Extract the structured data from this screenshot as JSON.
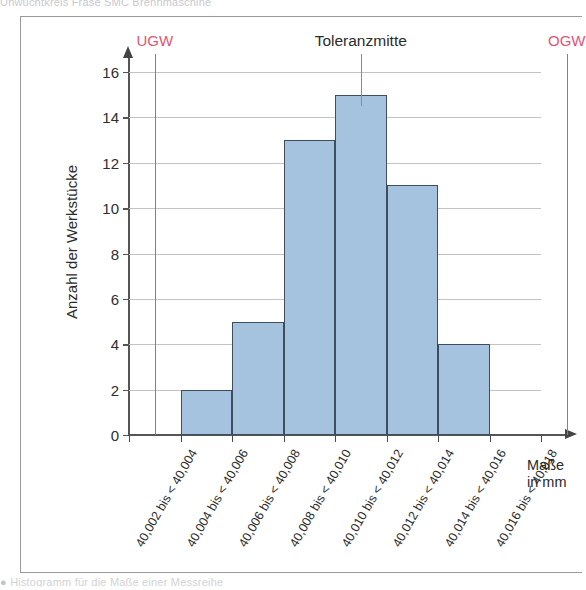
{
  "page": {
    "clipped_top_caption": "Unwuchtkreis Fräse SMC Brennmaschine",
    "clipped_bottom_caption": "Histogramm für die Maße einer Messreihe"
  },
  "chart_data": {
    "type": "bar",
    "title": "",
    "xlabel": "Maße in mm",
    "ylabel": "Anzahl der Werkstücke",
    "categories": [
      "40,002 bis < 40,004",
      "40,004 bis < 40,006",
      "40,006 bis < 40,008",
      "40,008 bis < 40,010",
      "40,010 bis < 40,012",
      "40,012 bis < 40,014",
      "40,014 bis < 40,016",
      "40,016 bis < 40,018"
    ],
    "values": [
      0,
      2,
      5,
      13,
      15,
      11,
      4,
      0
    ],
    "ylim": [
      0,
      16
    ],
    "yticks": [
      0,
      2,
      4,
      6,
      8,
      10,
      12,
      14,
      16
    ],
    "ytick_labels": [
      "0",
      "2",
      "4",
      "6",
      "8",
      "10",
      "12",
      "14",
      "16"
    ],
    "grid": true,
    "legend": "none",
    "bar_color": "#a5c3de",
    "bar_edge_color": "#3f4e5e",
    "annotations": [
      {
        "name": "UGW",
        "label": "UGW",
        "x_value": 40.003,
        "color": "#e05575"
      },
      {
        "name": "Toleranzmitte",
        "label": "Toleranzmitte",
        "x_value": 40.011,
        "color": "#e8607f"
      },
      {
        "name": "OGW",
        "label": "OGW",
        "x_value": 40.019,
        "color": "#e05575"
      }
    ]
  },
  "axis": {
    "x_title_line1": "Maße",
    "x_title_line2": "in mm"
  }
}
